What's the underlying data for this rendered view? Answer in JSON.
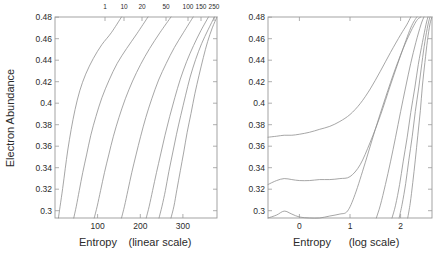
{
  "figure": {
    "title": "",
    "ylabel": "Electron Abundance",
    "panels": [
      {
        "id": "left",
        "xlabel_main": "Entropy",
        "xlabel_paren": "(linear scale)",
        "top_axis_caption": "",
        "x_ticks": [
          "100",
          "200",
          "300"
        ],
        "y_ticks": [
          "0.3",
          "0.32",
          "0.34",
          "0.36",
          "0.38",
          "0.4",
          "0.42",
          "0.44",
          "0.46",
          "0.48"
        ],
        "top_ticks": [
          "1",
          "10",
          "20",
          "50",
          "100",
          "150",
          "250"
        ]
      },
      {
        "id": "right",
        "xlabel_main": "Entropy",
        "xlabel_paren": "(log scale)",
        "x_ticks": [
          "0",
          "1",
          "2"
        ],
        "y_ticks": [
          "0.3",
          "0.32",
          "0.34",
          "0.36",
          "0.38",
          "0.4",
          "0.42",
          "0.44",
          "0.46",
          "0.48"
        ]
      }
    ]
  },
  "chart_data": [
    {
      "type": "line",
      "panel": "left",
      "title": "",
      "xlabel": "Entropy  (linear scale)",
      "ylabel": "Electron Abundance",
      "xlim": [
        0,
        380
      ],
      "ylim": [
        0.288,
        0.492
      ],
      "xticks": [
        100,
        200,
        300
      ],
      "yticks": [
        0.3,
        0.32,
        0.34,
        0.36,
        0.38,
        0.4,
        0.42,
        0.44,
        0.46,
        0.48
      ],
      "top_axis": {
        "label": "",
        "tick_values": [
          1,
          10,
          20,
          50,
          100,
          150,
          250
        ],
        "tick_labels": [
          "1",
          "10",
          "20",
          "50",
          "100",
          "150",
          "250"
        ]
      },
      "grid": false,
      "legend": "none",
      "series": [
        {
          "name": "1",
          "x": [
            8,
            12,
            18,
            24,
            30,
            38,
            47,
            58,
            72,
            90,
            110,
            132,
            156
          ],
          "y": [
            0.288,
            0.3,
            0.318,
            0.338,
            0.357,
            0.378,
            0.398,
            0.417,
            0.434,
            0.45,
            0.464,
            0.476,
            0.492
          ]
        },
        {
          "name": "10",
          "x": [
            44,
            50,
            57,
            65,
            74,
            84,
            96,
            110,
            127,
            146,
            168,
            192,
            218
          ],
          "y": [
            0.288,
            0.3,
            0.316,
            0.334,
            0.352,
            0.372,
            0.391,
            0.41,
            0.428,
            0.445,
            0.46,
            0.475,
            0.492
          ]
        },
        {
          "name": "20",
          "x": [
            92,
            99,
            107,
            116,
            126,
            137,
            150,
            165,
            182,
            201,
            222,
            246,
            272
          ],
          "y": [
            0.288,
            0.3,
            0.316,
            0.334,
            0.352,
            0.371,
            0.39,
            0.409,
            0.427,
            0.444,
            0.46,
            0.476,
            0.492
          ]
        },
        {
          "name": "50",
          "x": [
            156,
            163,
            171,
            180,
            190,
            201,
            213,
            227,
            243,
            261,
            280,
            301,
            324
          ],
          "y": [
            0.288,
            0.3,
            0.316,
            0.334,
            0.352,
            0.371,
            0.39,
            0.409,
            0.428,
            0.445,
            0.461,
            0.476,
            0.492
          ]
        },
        {
          "name": "100",
          "x": [
            214,
            221,
            229,
            238,
            248,
            258,
            269,
            281,
            294,
            309,
            325,
            342,
            360
          ],
          "y": [
            0.288,
            0.3,
            0.316,
            0.334,
            0.353,
            0.372,
            0.391,
            0.41,
            0.429,
            0.447,
            0.463,
            0.478,
            0.492
          ]
        },
        {
          "name": "150",
          "x": [
            244,
            251,
            259,
            267,
            276,
            285,
            295,
            306,
            317,
            330,
            344,
            359,
            374
          ],
          "y": [
            0.288,
            0.3,
            0.316,
            0.335,
            0.354,
            0.373,
            0.392,
            0.412,
            0.431,
            0.449,
            0.465,
            0.479,
            0.492
          ]
        },
        {
          "name": "250",
          "x": [
            272,
            279,
            286,
            294,
            302,
            310,
            319,
            328,
            338,
            348,
            358,
            369,
            380
          ],
          "y": [
            0.288,
            0.3,
            0.317,
            0.336,
            0.355,
            0.375,
            0.394,
            0.414,
            0.433,
            0.451,
            0.467,
            0.481,
            0.492
          ]
        }
      ]
    },
    {
      "type": "line",
      "panel": "right",
      "title": "",
      "xlabel": "Entropy  (log scale)",
      "ylabel": "Electron Abundance",
      "xlim": [
        -0.62,
        2.62
      ],
      "ylim": [
        0.288,
        0.492
      ],
      "xticks": [
        0,
        1,
        2
      ],
      "yticks": [
        0.3,
        0.32,
        0.34,
        0.36,
        0.38,
        0.4,
        0.42,
        0.44,
        0.46,
        0.48
      ],
      "grid": false,
      "legend": "none",
      "series": [
        {
          "name": "1",
          "x": [
            -0.62,
            -0.45,
            -0.3,
            -0.15,
            0.0,
            0.2,
            0.4,
            0.6,
            0.8,
            1.0,
            1.2,
            1.4,
            1.6,
            1.8,
            2.0,
            2.12,
            2.2
          ],
          "y": [
            0.37,
            0.371,
            0.372,
            0.372,
            0.373,
            0.375,
            0.378,
            0.381,
            0.386,
            0.393,
            0.404,
            0.419,
            0.437,
            0.456,
            0.474,
            0.484,
            0.492
          ]
        },
        {
          "name": "10",
          "x": [
            -0.62,
            -0.45,
            -0.3,
            -0.15,
            0.0,
            0.2,
            0.4,
            0.6,
            0.8,
            1.0,
            1.2,
            1.4,
            1.6,
            1.8,
            2.0,
            2.2,
            2.32
          ],
          "y": [
            0.322,
            0.326,
            0.328,
            0.327,
            0.326,
            0.326,
            0.327,
            0.327,
            0.328,
            0.33,
            0.342,
            0.365,
            0.392,
            0.423,
            0.453,
            0.481,
            0.492
          ]
        },
        {
          "name": "20",
          "x": [
            -0.62,
            -0.45,
            -0.3,
            -0.15,
            0.0,
            0.2,
            0.4,
            0.6,
            0.8,
            0.95,
            1.1,
            1.3,
            1.5,
            1.7,
            1.9,
            2.1,
            2.3,
            2.4
          ],
          "y": [
            0.288,
            0.291,
            0.295,
            0.292,
            0.289,
            0.288,
            0.288,
            0.29,
            0.292,
            0.295,
            0.312,
            0.344,
            0.378,
            0.41,
            0.44,
            0.466,
            0.487,
            0.492
          ]
        },
        {
          "name": "50",
          "x": [
            1.52,
            1.6,
            1.7,
            1.8,
            1.9,
            2.0,
            2.1,
            2.2,
            2.3,
            2.4,
            2.46
          ],
          "y": [
            0.288,
            0.301,
            0.322,
            0.345,
            0.37,
            0.396,
            0.421,
            0.445,
            0.466,
            0.484,
            0.492
          ]
        },
        {
          "name": "100",
          "x": [
            1.83,
            1.9,
            1.98,
            2.05,
            2.13,
            2.2,
            2.28,
            2.35,
            2.43,
            2.5,
            2.54
          ],
          "y": [
            0.288,
            0.301,
            0.322,
            0.345,
            0.37,
            0.395,
            0.42,
            0.444,
            0.466,
            0.484,
            0.492
          ]
        },
        {
          "name": "150",
          "x": [
            1.97,
            2.03,
            2.1,
            2.16,
            2.23,
            2.29,
            2.36,
            2.42,
            2.48,
            2.54,
            2.58
          ],
          "y": [
            0.288,
            0.302,
            0.323,
            0.346,
            0.371,
            0.396,
            0.421,
            0.445,
            0.467,
            0.484,
            0.492
          ]
        },
        {
          "name": "250",
          "x": [
            2.14,
            2.19,
            2.24,
            2.29,
            2.34,
            2.39,
            2.43,
            2.48,
            2.53,
            2.58,
            2.62
          ],
          "y": [
            0.288,
            0.303,
            0.324,
            0.347,
            0.372,
            0.397,
            0.422,
            0.446,
            0.468,
            0.485,
            0.492
          ]
        }
      ]
    }
  ],
  "style": {
    "curve_color": "#8f8f8f",
    "axis_color": "#9a9a9a",
    "text_color": "#2b2b2b",
    "background": "#ffffff"
  }
}
